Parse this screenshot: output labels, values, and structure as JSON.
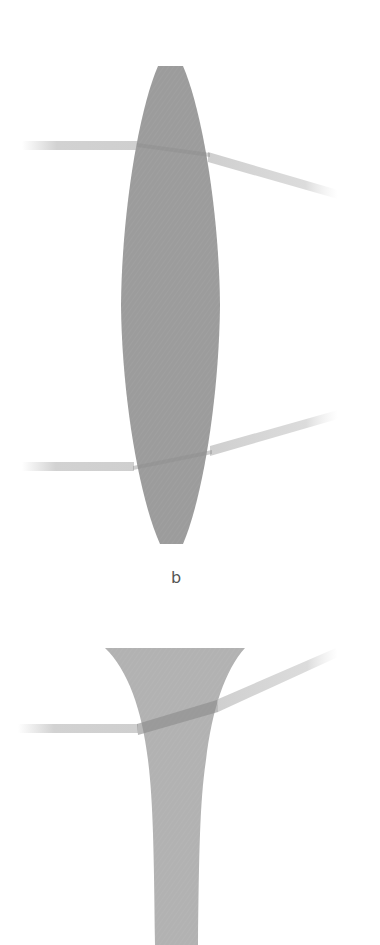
{
  "figure": {
    "panels": [
      {
        "id": "a",
        "type": "convex-lens",
        "description": "Converging (convex) lens refracting two parallel rays toward each other",
        "lens_color": "#9c9c9c",
        "ray_color": "#d2d2d2"
      },
      {
        "id": "b",
        "type": "concave-lens",
        "label": "b",
        "description": "Diverging (concave) lens refracting a parallel ray away from the axis",
        "lens_color": "#b2b2b2",
        "ray_color": "#d2d2d2"
      }
    ]
  },
  "labels": {
    "panel_b": "b"
  }
}
